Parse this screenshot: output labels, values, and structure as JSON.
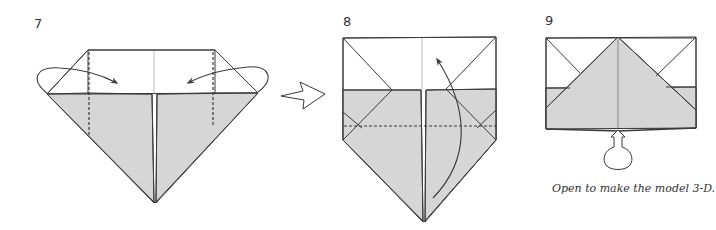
{
  "colors": {
    "line": "#3a3a3a",
    "shade": "#d6d6d6",
    "paper": "#ffffff",
    "text": "#333333"
  },
  "steps": [
    {
      "number": "7",
      "instruction_icons": [
        "fold-behind-arrow-left",
        "fold-behind-arrow-right",
        "valley-fold-dashed-line-left",
        "valley-fold-dashed-line-right"
      ]
    },
    {
      "number": "8",
      "instruction_icons": [
        "valley-fold-dashed-line",
        "fold-up-arrow"
      ]
    },
    {
      "number": "9",
      "instruction_icons": [
        "inflate-open-arrow"
      ]
    }
  ],
  "transition_arrow": "hollow-right-arrow",
  "caption": "Open to make the model 3-D."
}
